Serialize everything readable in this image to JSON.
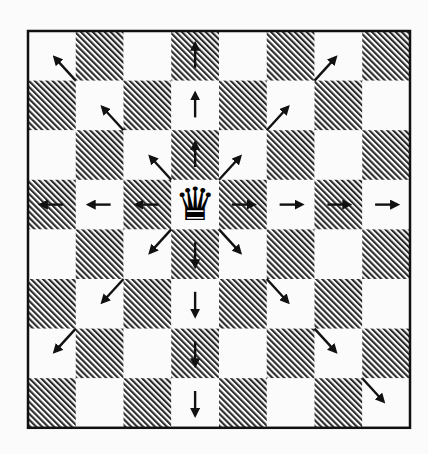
{
  "diagram": {
    "title": "Queen movement on a chessboard",
    "board": {
      "files": 8,
      "ranks": 8,
      "left": 28,
      "top": 31,
      "square_width": 47.75,
      "square_height": 49.6,
      "top_left_square": "light",
      "light_color": "#fbfbfb",
      "dark_hatch_color": "#2a2a2a",
      "border_color": "#111111",
      "border_width": 2.5
    },
    "piece": {
      "name": "queen",
      "color": "black",
      "glyph": "♛",
      "row": 3,
      "col": 3
    },
    "arrow_color": "#111111",
    "arrows": [
      {
        "dir": "up",
        "squares": [
          [
            2,
            3
          ],
          [
            1,
            3
          ],
          [
            0,
            3
          ]
        ]
      },
      {
        "dir": "down",
        "squares": [
          [
            4,
            3
          ],
          [
            5,
            3
          ],
          [
            6,
            3
          ],
          [
            7,
            3
          ]
        ]
      },
      {
        "dir": "left",
        "squares": [
          [
            3,
            2
          ],
          [
            3,
            1
          ],
          [
            3,
            0
          ]
        ]
      },
      {
        "dir": "right",
        "squares": [
          [
            3,
            4
          ],
          [
            3,
            5
          ],
          [
            3,
            6
          ],
          [
            3,
            7
          ]
        ]
      },
      {
        "dir": "up-left",
        "squares": [
          [
            2,
            2
          ],
          [
            1,
            1
          ],
          [
            0,
            0
          ]
        ]
      },
      {
        "dir": "up-right",
        "squares": [
          [
            2,
            4
          ],
          [
            1,
            5
          ],
          [
            0,
            6
          ]
        ]
      },
      {
        "dir": "down-left",
        "squares": [
          [
            4,
            2
          ],
          [
            5,
            1
          ],
          [
            6,
            0
          ]
        ]
      },
      {
        "dir": "down-right",
        "squares": [
          [
            4,
            4
          ],
          [
            5,
            5
          ],
          [
            6,
            6
          ],
          [
            7,
            7
          ]
        ]
      }
    ]
  }
}
